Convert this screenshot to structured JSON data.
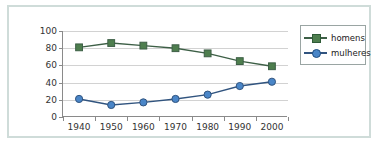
{
  "chart_data": {
    "type": "line",
    "title": "",
    "xlabel": "",
    "ylabel": "",
    "categories": [
      "1940",
      "1950",
      "1960",
      "1970",
      "1980",
      "1990",
      "2000"
    ],
    "series": [
      {
        "name": "homens",
        "color": "#4e7e4e",
        "line_color": "#3d5f46",
        "marker": "square",
        "values": [
          81,
          86,
          83,
          80,
          74,
          65,
          59
        ]
      },
      {
        "name": "mulheres",
        "color": "#4a86c8",
        "line_color": "#31547f",
        "marker": "circle",
        "values": [
          21,
          14,
          17,
          21,
          26,
          36,
          41
        ]
      }
    ],
    "ylim": [
      0,
      100
    ],
    "yticks": [
      0,
      20,
      40,
      60,
      80,
      100
    ],
    "ytick_labels": [
      "0",
      "20",
      "40",
      "60",
      "80",
      "100"
    ],
    "grid": true,
    "legend_position": "right"
  },
  "legend": {
    "items": [
      {
        "label": "homens"
      },
      {
        "label": "mulheres"
      }
    ]
  },
  "colors": {
    "homens": "#4e7e4e",
    "mulheres": "#4a86c8",
    "frame_border": "#cfdcd9",
    "axis": "#8a8a8a",
    "gridline": "#d2d2d2",
    "background": "#ffffff"
  }
}
